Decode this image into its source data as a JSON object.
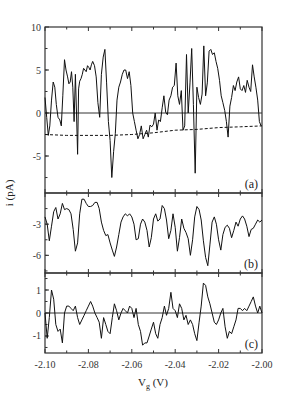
{
  "chart_data": {
    "type": "line",
    "title": "",
    "xlabel": "V_g (V)",
    "ylabel": "i (pA)",
    "xlim": [
      -2.1,
      -2.0
    ],
    "x_ticks": [
      "-2.10",
      "-2.08",
      "-2.06",
      "-2.04",
      "-2.02",
      "-2.00"
    ],
    "grid": false,
    "legend": null,
    "panels": [
      {
        "label": "(a)",
        "ylim": [
          -9.3,
          10
        ],
        "y_ticks": [
          "10",
          "5",
          "0",
          "-5"
        ],
        "zero_line": true,
        "series": [
          {
            "name": "current",
            "style": "solid",
            "x": [
              -2.1,
              -2.0992,
              -2.0985,
              -2.0978,
              -2.097,
              -2.0962,
              -2.0955,
              -2.0948,
              -2.094,
              -2.0932,
              -2.0925,
              -2.0918,
              -2.091,
              -2.0903,
              -2.0896,
              -2.089,
              -2.0884,
              -2.0878,
              -2.0872,
              -2.0866,
              -2.086,
              -2.0855,
              -2.085,
              -2.0845,
              -2.084,
              -2.0834,
              -2.0828,
              -2.0822,
              -2.0816,
              -2.081,
              -2.0804,
              -2.0798,
              -2.0792,
              -2.0786,
              -2.078,
              -2.0772,
              -2.0764,
              -2.0756,
              -2.0748,
              -2.074,
              -2.0732,
              -2.0724,
              -2.0716,
              -2.0708,
              -2.07,
              -2.0692,
              -2.0684,
              -2.0676,
              -2.0668,
              -2.066,
              -2.0652,
              -2.0644,
              -2.0636,
              -2.0628,
              -2.062,
              -2.0612,
              -2.0604,
              -2.0596,
              -2.0588,
              -2.058,
              -2.0572,
              -2.0564,
              -2.0556,
              -2.0548,
              -2.054,
              -2.0532,
              -2.0524,
              -2.0516,
              -2.0508,
              -2.05,
              -2.0492,
              -2.0484,
              -2.0476,
              -2.0468,
              -2.046,
              -2.0452,
              -2.0444,
              -2.0436,
              -2.0428,
              -2.042,
              -2.0412,
              -2.0404,
              -2.0396,
              -2.0388,
              -2.038,
              -2.0372,
              -2.0364,
              -2.0356,
              -2.0348,
              -2.034,
              -2.0332,
              -2.0324,
              -2.0316,
              -2.0308,
              -2.03,
              -2.0292,
              -2.0284,
              -2.0276,
              -2.0268,
              -2.026,
              -2.0252,
              -2.0244,
              -2.0236,
              -2.0228,
              -2.022,
              -2.0212,
              -2.0204,
              -2.0196,
              -2.0188,
              -2.018,
              -2.0172,
              -2.0164,
              -2.0156,
              -2.0148,
              -2.014,
              -2.0132,
              -2.0124,
              -2.0116,
              -2.0108,
              -2.01,
              -2.0092,
              -2.0084,
              -2.0076,
              -2.0068,
              -2.006,
              -2.0052,
              -2.0044,
              -2.0036,
              -2.0028,
              -2.002,
              -2.0012,
              -2.0004,
              -2.0
            ],
            "y": [
              1.8,
              -0.5,
              -2.6,
              -1.5,
              1.5,
              3.6,
              3.0,
              1.0,
              -0.5,
              -0.8,
              -1.5,
              2.0,
              6.2,
              5.0,
              4.2,
              3.4,
              3.6,
              4.8,
              3.0,
              -1.0,
              4.5,
              0.0,
              -4.8,
              2.8,
              3.7,
              4.0,
              4.5,
              5.2,
              5.0,
              4.8,
              5.5,
              5.3,
              5.0,
              5.6,
              6.0,
              5.5,
              4.2,
              1.2,
              -0.5,
              4.5,
              6.5,
              7.4,
              3.5,
              -1.0,
              -3.2,
              -7.5,
              -4.5,
              -2.4,
              1.5,
              3.0,
              3.6,
              4.5,
              5.0,
              5.0,
              4.0,
              4.8,
              3.2,
              0.0,
              -1.0,
              -2.0,
              -3.0,
              -2.5,
              -1.5,
              -3.0,
              -2.5,
              -2.0,
              -2.8,
              -1.4,
              -1.6,
              -1.3,
              0.0,
              -2.0,
              -0.8,
              -1.0,
              0.6,
              2.0,
              0.1,
              -0.2,
              1.5,
              2.0,
              3.0,
              3.2,
              5.8,
              2.0,
              1.0,
              2.6,
              -2.0,
              -1.5,
              6.8,
              0.0,
              3.5,
              7.5,
              1.0,
              -7.0,
              3.0,
              1.8,
              1.0,
              2.2,
              7.8,
              2.0,
              3.5,
              7.2,
              7.4,
              6.8,
              7.0,
              6.0,
              5.2,
              3.8,
              2.0,
              1.2,
              0.3,
              -1.0,
              -2.8,
              0.8,
              1.8,
              3.2,
              2.6,
              3.6,
              4.2,
              2.8,
              2.6,
              3.2,
              2.4,
              3.8,
              3.0,
              2.5,
              5.6,
              4.2,
              3.0,
              1.5,
              -1.0,
              -1.5
            ]
          },
          {
            "name": "baseline",
            "style": "dashed",
            "x": [
              -2.1,
              -2.09,
              -2.08,
              -2.07,
              -2.06,
              -2.05,
              -2.04,
              -2.03,
              -2.02,
              -2.01,
              -2.0
            ],
            "y": [
              -2.5,
              -2.6,
              -2.6,
              -2.6,
              -2.5,
              -2.3,
              -2.0,
              -1.9,
              -1.7,
              -1.6,
              -1.5
            ]
          }
        ]
      },
      {
        "label": "(b)",
        "ylim": [
          -7.7,
          0
        ],
        "y_ticks": [
          "-3",
          "-6"
        ],
        "zero_line": false,
        "series": [
          {
            "name": "current",
            "style": "solid",
            "x": [
              -2.1,
              -2.099,
              -2.098,
              -2.097,
              -2.096,
              -2.095,
              -2.094,
              -2.093,
              -2.092,
              -2.091,
              -2.09,
              -2.089,
              -2.088,
              -2.087,
              -2.086,
              -2.085,
              -2.084,
              -2.083,
              -2.082,
              -2.081,
              -2.08,
              -2.079,
              -2.078,
              -2.077,
              -2.076,
              -2.075,
              -2.074,
              -2.073,
              -2.072,
              -2.071,
              -2.07,
              -2.069,
              -2.068,
              -2.067,
              -2.066,
              -2.065,
              -2.064,
              -2.063,
              -2.062,
              -2.061,
              -2.06,
              -2.059,
              -2.058,
              -2.057,
              -2.056,
              -2.055,
              -2.054,
              -2.053,
              -2.052,
              -2.051,
              -2.05,
              -2.049,
              -2.048,
              -2.047,
              -2.046,
              -2.045,
              -2.044,
              -2.043,
              -2.042,
              -2.041,
              -2.04,
              -2.039,
              -2.038,
              -2.037,
              -2.036,
              -2.035,
              -2.034,
              -2.033,
              -2.032,
              -2.031,
              -2.03,
              -2.029,
              -2.028,
              -2.027,
              -2.026,
              -2.025,
              -2.024,
              -2.023,
              -2.022,
              -2.021,
              -2.02,
              -2.019,
              -2.018,
              -2.017,
              -2.016,
              -2.015,
              -2.014,
              -2.013,
              -2.012,
              -2.011,
              -2.01,
              -2.009,
              -2.008,
              -2.007,
              -2.006,
              -2.005,
              -2.004,
              -2.003,
              -2.002,
              -2.001,
              -2.0
            ],
            "y": [
              -2.3,
              -3.0,
              -4.6,
              -3.2,
              -1.8,
              -1.4,
              -2.5,
              -2.0,
              -1.0,
              -1.6,
              -1.5,
              -1.6,
              -2.0,
              -3.5,
              -5.6,
              -4.8,
              -2.0,
              -0.6,
              -0.6,
              -1.0,
              -1.3,
              -1.3,
              -1.2,
              -0.9,
              -0.9,
              -1.5,
              -2.8,
              -3.6,
              -4.1,
              -4.0,
              -4.8,
              -5.5,
              -6.1,
              -5.2,
              -4.0,
              -2.8,
              -2.3,
              -2.0,
              -2.2,
              -2.0,
              -2.3,
              -3.0,
              -4.5,
              -4.4,
              -3.0,
              -2.5,
              -2.8,
              -3.6,
              -5.2,
              -4.3,
              -2.5,
              -2.0,
              -2.7,
              -2.5,
              -1.2,
              -1.5,
              -2.6,
              -4.4,
              -3.6,
              -2.0,
              -3.3,
              -5.6,
              -4.3,
              -2.5,
              -3.4,
              -3.8,
              -4.4,
              -6.0,
              -4.5,
              -2.3,
              -1.3,
              -1.6,
              -2.6,
              -4.6,
              -6.2,
              -7.0,
              -5.0,
              -2.8,
              -2.3,
              -3.0,
              -4.5,
              -5.5,
              -4.0,
              -3.3,
              -3.1,
              -3.4,
              -4.3,
              -3.6,
              -2.8,
              -3.2,
              -2.5,
              -2.2,
              -2.5,
              -3.2,
              -4.2,
              -3.5,
              -3.4,
              -3.0,
              -2.6,
              -2.8,
              -2.6
            ]
          }
        ]
      },
      {
        "label": "(c)",
        "ylim": [
          -1.74,
          1.74
        ],
        "y_ticks": [
          "1",
          "0",
          "-1"
        ],
        "zero_line": true,
        "series": [
          {
            "name": "current",
            "style": "solid",
            "x": [
              -2.1,
              -2.099,
              -2.098,
              -2.097,
              -2.096,
              -2.095,
              -2.094,
              -2.093,
              -2.092,
              -2.091,
              -2.09,
              -2.089,
              -2.088,
              -2.087,
              -2.086,
              -2.085,
              -2.084,
              -2.083,
              -2.082,
              -2.081,
              -2.08,
              -2.079,
              -2.078,
              -2.077,
              -2.076,
              -2.075,
              -2.074,
              -2.073,
              -2.072,
              -2.071,
              -2.07,
              -2.069,
              -2.068,
              -2.067,
              -2.066,
              -2.065,
              -2.064,
              -2.063,
              -2.062,
              -2.061,
              -2.06,
              -2.059,
              -2.058,
              -2.057,
              -2.056,
              -2.055,
              -2.054,
              -2.053,
              -2.052,
              -2.051,
              -2.05,
              -2.049,
              -2.048,
              -2.047,
              -2.046,
              -2.045,
              -2.044,
              -2.043,
              -2.042,
              -2.041,
              -2.04,
              -2.039,
              -2.038,
              -2.037,
              -2.036,
              -2.035,
              -2.034,
              -2.033,
              -2.032,
              -2.031,
              -2.03,
              -2.029,
              -2.028,
              -2.027,
              -2.026,
              -2.025,
              -2.024,
              -2.023,
              -2.022,
              -2.021,
              -2.02,
              -2.019,
              -2.018,
              -2.017,
              -2.016,
              -2.015,
              -2.014,
              -2.013,
              -2.012,
              -2.011,
              -2.01,
              -2.009,
              -2.008,
              -2.007,
              -2.006,
              -2.005,
              -2.004,
              -2.003,
              -2.002,
              -2.001,
              -2.0
            ],
            "y": [
              0.0,
              -1.1,
              -0.2,
              1.0,
              0.6,
              -0.5,
              -0.8,
              -0.7,
              -1.3,
              0.0,
              0.3,
              0.3,
              0.2,
              0.1,
              0.3,
              -0.2,
              -0.5,
              -0.3,
              -0.1,
              0.1,
              0.3,
              0.5,
              0.3,
              0.0,
              -0.2,
              -0.4,
              -1.1,
              -0.2,
              -0.5,
              -0.8,
              -0.9,
              -0.2,
              0.4,
              0.1,
              -0.3,
              0.0,
              0.2,
              0.1,
              0.0,
              0.3,
              0.2,
              -0.2,
              0.2,
              -0.5,
              -0.8,
              -1.4,
              -1.3,
              -1.3,
              -1.0,
              -0.7,
              -0.4,
              -0.9,
              -1.1,
              -0.5,
              -0.2,
              0.3,
              -0.1,
              0.2,
              0.9,
              0.2,
              0.1,
              -0.2,
              0.4,
              0.2,
              -0.3,
              -0.1,
              -0.5,
              -0.3,
              -0.5,
              -0.9,
              -1.2,
              -0.4,
              0.3,
              1.3,
              1.2,
              0.7,
              0.4,
              0.0,
              -0.4,
              -0.5,
              -0.3,
              0.0,
              0.2,
              -0.6,
              -1.1,
              -0.8,
              -0.9,
              -0.6,
              -0.3,
              0.2,
              0.2,
              0.1,
              0.2,
              0.1,
              0.3,
              0.5,
              0.7,
              0.3,
              0.0,
              0.3,
              0.0
            ]
          }
        ]
      }
    ]
  },
  "labels": {
    "ylabel": "i (pA)",
    "xlabel_main": "V",
    "xlabel_sub": "g",
    "xlabel_unit": " (V)"
  }
}
